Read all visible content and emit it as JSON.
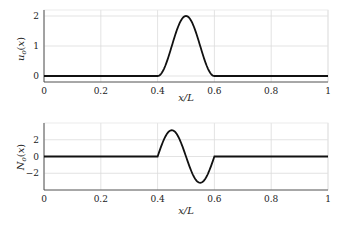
{
  "chart_data": [
    {
      "type": "line",
      "title": "",
      "xlabel": "x/L",
      "ylabel": "u_o(x)",
      "xlim": [
        0,
        1
      ],
      "ylim": [
        -0.2,
        2.2
      ],
      "xticks": [
        "0",
        "0.2",
        "0.4",
        "0.6",
        "0.8",
        "1"
      ],
      "yticks": [
        "0",
        "1",
        "2"
      ],
      "grid": true,
      "series": [
        {
          "name": "u_o(x)",
          "description": "Smooth bump 1-cos(2π(x-0.4)/0.2) on [0.4,0.6], zero elsewhere",
          "x": [
            0,
            0.4,
            0.425,
            0.45,
            0.475,
            0.5,
            0.525,
            0.55,
            0.575,
            0.6,
            1
          ],
          "y": [
            0,
            0,
            0.29,
            1.0,
            1.71,
            2.0,
            1.71,
            1.0,
            0.29,
            0,
            0
          ]
        }
      ]
    },
    {
      "type": "line",
      "title": "",
      "xlabel": "x/L",
      "ylabel": "N_o(x)",
      "xlim": [
        0,
        1
      ],
      "ylim": [
        -4,
        4
      ],
      "xticks": [
        "0",
        "0.2",
        "0.4",
        "0.6",
        "0.8",
        "1"
      ],
      "yticks": [
        "-2",
        "0",
        "2"
      ],
      "grid": true,
      "series": [
        {
          "name": "N_o(x)",
          "description": "π·sin(2π(x-0.4)/0.2) on [0.4,0.6], zero elsewhere",
          "x": [
            0,
            0.4,
            0.425,
            0.45,
            0.475,
            0.5,
            0.525,
            0.55,
            0.575,
            0.6,
            1
          ],
          "y": [
            0,
            0,
            2.22,
            3.14,
            2.22,
            0,
            -2.22,
            -3.14,
            -2.22,
            0,
            0
          ]
        }
      ]
    }
  ],
  "top": {
    "ylabel": "u",
    "ysub": "o",
    "yarg": "(x)",
    "xlabel": "x/L"
  },
  "bottom": {
    "ylabel": "N",
    "ysub": "o",
    "yarg": "(x)",
    "xlabel": "x/L"
  }
}
